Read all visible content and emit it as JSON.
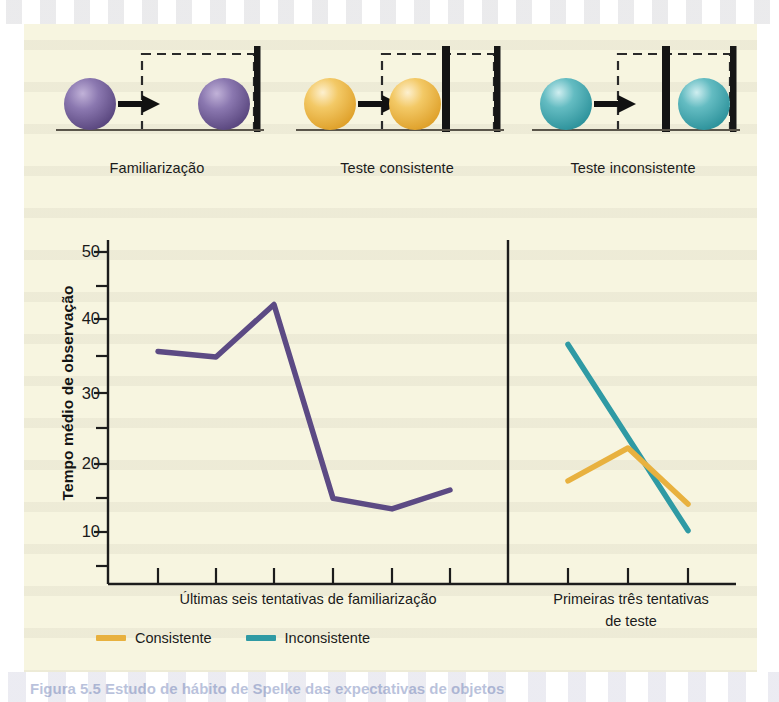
{
  "figure": {
    "background_color": "#f7f5e0",
    "caption_fragment": "Figura 5.5   Estudo de hábito de Spelke das expectativas de objetos"
  },
  "diagram": {
    "scenarios": [
      {
        "id": "familiarization",
        "caption": "Familiarização",
        "ball_color": "#6e5a96",
        "ball_highlight": "#b3a3cc",
        "has_barrier": false,
        "barrier_visible": false
      },
      {
        "id": "consistent-test",
        "caption": "Teste consistente",
        "ball_color": "#e8b13f",
        "ball_highlight": "#f7e3ae",
        "has_barrier": true,
        "barrier_visible": true
      },
      {
        "id": "inconsistent-test",
        "caption": "Teste inconsistente",
        "ball_color": "#3fa3ad",
        "ball_highlight": "#aadce0",
        "has_barrier": true,
        "barrier_visible": true
      }
    ]
  },
  "chart_data": {
    "type": "line",
    "title": "",
    "xlabel": "",
    "ylabel": "Tempo médio de observação",
    "ylim": [
      0,
      50
    ],
    "ytick_labels": [
      "10",
      "20",
      "30",
      "40",
      "50"
    ],
    "ytick_values": [
      10,
      20,
      30,
      40,
      50
    ],
    "yminor_ticks": [
      5,
      15,
      25,
      35,
      45
    ],
    "grid": false,
    "legend_position": "bottom-left",
    "panels": [
      {
        "name": "familiarization",
        "xlabel": "Últimas seis tentativas de familiarização",
        "n_trials": 6,
        "series": [
          {
            "name": "Familiarização",
            "color": "#5c4a84",
            "x": [
              1,
              2,
              3,
              4,
              5,
              6
            ],
            "values": [
              35.8,
              35.0,
              42.5,
              14.8,
              13.3,
              16.0
            ]
          }
        ]
      },
      {
        "name": "test",
        "xlabel": "Primeiras três tentativas de teste",
        "n_trials": 3,
        "series": [
          {
            "name": "Consistente",
            "color": "#e8b13f",
            "x": [
              1,
              2,
              3
            ],
            "values": [
              17.3,
              22.0,
              14.0
            ]
          },
          {
            "name": "Inconsistente",
            "color": "#2f9aa4",
            "x": [
              1,
              2,
              3
            ],
            "values": [
              36.8,
              23.5,
              10.2
            ]
          }
        ]
      }
    ],
    "legend": [
      {
        "label": "Consistente",
        "color": "#e8b13f"
      },
      {
        "label": "Inconsistente",
        "color": "#2f9aa4"
      }
    ]
  },
  "axis": {
    "label_y": "Tempo médio de observação",
    "xcaption_left": "Últimas seis tentativas de familiarização",
    "xcaption_right_line1": "Primeiras três tentativas",
    "xcaption_right_line2": "de teste"
  }
}
